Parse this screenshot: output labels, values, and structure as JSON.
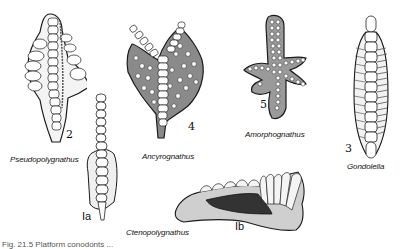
{
  "figure": {
    "specimens": [
      {
        "id": "2",
        "number": "2",
        "name": "Pseudopolygnathus"
      },
      {
        "id": "4",
        "number": "4",
        "name": "Ancyrognathus"
      },
      {
        "id": "5",
        "number": "5",
        "name": "Amorphognathus"
      },
      {
        "id": "3",
        "number": "3",
        "name": "Gondolella"
      },
      {
        "id": "1a",
        "number": "Ia",
        "name": ""
      },
      {
        "id": "1b",
        "number": "Ib",
        "name": "Ctenopolygnathus"
      }
    ],
    "caption": "Fig. 21.5   Platform conodonts ..."
  },
  "colors": {
    "ink": "#1a1a1a",
    "shade": "#555555",
    "dark_fill": "#333333",
    "background": "#ffffff"
  }
}
